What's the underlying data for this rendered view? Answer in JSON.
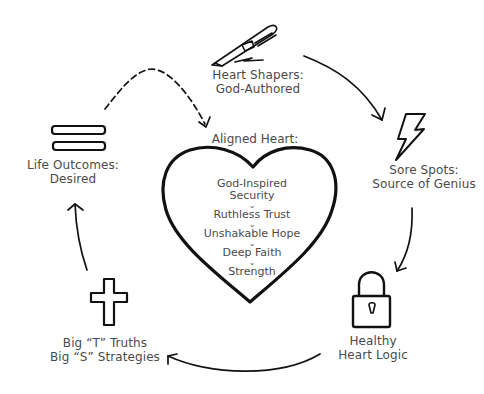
{
  "diagram": {
    "center": {
      "title": "Aligned Heart:",
      "items": [
        "God-Inspired",
        "Security",
        "Ruthless Trust",
        "Unshakable Hope",
        "Deep Faith",
        "Strength"
      ],
      "icon": "heart-icon"
    },
    "nodes": [
      {
        "id": "heart-shapers",
        "icon": "pen-icon",
        "line1": "Heart Shapers:",
        "line2": "God-Authored"
      },
      {
        "id": "sore-spots",
        "icon": "lightning-bolt-icon",
        "line1": "Sore Spots:",
        "line2": "Source of Genius"
      },
      {
        "id": "healthy-heart-logic",
        "icon": "padlock-icon",
        "line1": "Healthy",
        "line2": "Heart Logic"
      },
      {
        "id": "big-truths",
        "icon": "cross-icon",
        "line1": "Big “T” Truths",
        "line2": "Big “S” Strategies"
      },
      {
        "id": "life-outcomes",
        "icon": "equals-icon",
        "line1": "Life Outcomes:",
        "line2": "Desired"
      }
    ],
    "arrows": [
      {
        "from": "heart-shapers",
        "to": "sore-spots",
        "style": "solid"
      },
      {
        "from": "sore-spots",
        "to": "healthy-heart-logic",
        "style": "solid"
      },
      {
        "from": "healthy-heart-logic",
        "to": "big-truths",
        "style": "solid"
      },
      {
        "from": "big-truths",
        "to": "life-outcomes",
        "style": "solid"
      },
      {
        "from": "life-outcomes",
        "to": "aligned-heart",
        "style": "dashed"
      }
    ],
    "colors": {
      "stroke": "#111111",
      "text": "#4a4a4a",
      "background": "#ffffff"
    }
  }
}
